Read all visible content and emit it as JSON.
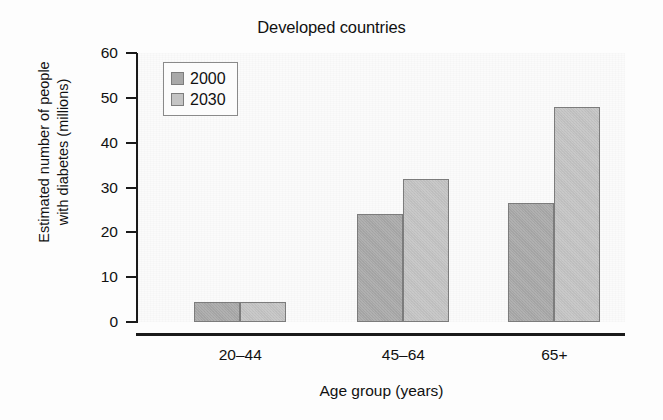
{
  "chart_data": {
    "type": "bar",
    "title": "Developed countries",
    "xlabel": "Age group (years)",
    "ylabel": "Estimated number of people with diabetes (millions)",
    "ylabel_line1": "Estimated number of people",
    "ylabel_line2": "with diabetes (millions)",
    "categories": [
      "20–44",
      "45–64",
      "65+"
    ],
    "series": [
      {
        "name": "2000",
        "values": [
          4.5,
          24.0,
          26.5
        ],
        "color": "#a9a9a9"
      },
      {
        "name": "2030",
        "values": [
          4.5,
          31.8,
          48.0
        ],
        "color": "#c4c4c4"
      }
    ],
    "ylim": [
      0,
      60
    ],
    "yticks": [
      0,
      10,
      20,
      30,
      40,
      50,
      60
    ],
    "ytick_labels": [
      "0",
      "10",
      "20",
      "30",
      "40",
      "50",
      "60"
    ],
    "grid": false,
    "legend_position": "upper-left",
    "bar_edge_color": "#7d7d7d",
    "axis_color": "#1a1a1a"
  },
  "legend": {
    "entries": [
      {
        "label": "2000"
      },
      {
        "label": "2030"
      }
    ]
  }
}
